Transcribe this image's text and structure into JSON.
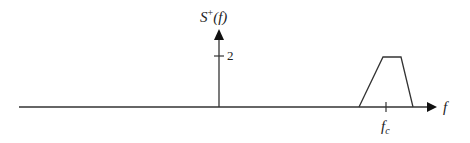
{
  "diagram": {
    "type": "spectrum-sketch",
    "y_axis_label": {
      "base": "S",
      "superscript": "+",
      "arg": "(f)"
    },
    "x_axis_label": "f",
    "impulse": {
      "position_label": "0",
      "height_label": "2"
    },
    "band": {
      "shape": "trapezoid",
      "center_label": "f",
      "center_subscript": "c"
    },
    "colors": {
      "stroke": "#333333",
      "background": "#ffffff"
    }
  }
}
